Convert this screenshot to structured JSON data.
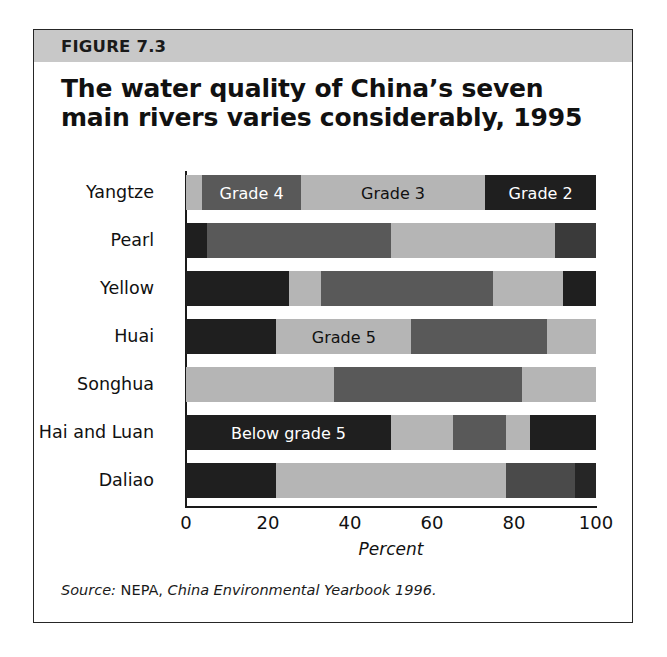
{
  "figure": {
    "number_label": "FIGURE 7.3",
    "title": "The water quality of China’s seven main rivers varies considerably, 1995",
    "source_prefix": "Source:",
    "source_agency": " NEPA, ",
    "source_title": "China Environmental Yearbook 1996."
  },
  "colors": {
    "header_band": "#c8c8c8",
    "border": "#262626",
    "grade2": "#1f1f1f",
    "grade3": "#b5b5b5",
    "grade4": "#595959",
    "grade5": "#b5b5b5",
    "below_grade5": "#1f1f1f",
    "text_light": "#ffffff",
    "text_dark": "#111111"
  },
  "chart_data": {
    "type": "bar",
    "orientation": "horizontal",
    "stacked": true,
    "normalized": true,
    "title": "The water quality of China’s seven main rivers varies considerably, 1995",
    "xlabel": "Percent",
    "ylabel": "",
    "xlim": [
      0,
      100
    ],
    "xticks": [
      0,
      20,
      40,
      60,
      80,
      100
    ],
    "xtick_labels": [
      "0",
      "20",
      "40",
      "60",
      "80",
      "100"
    ],
    "grid": false,
    "legend_position": "inline-annotations",
    "categories": [
      "Yangtze",
      "Pearl",
      "Yellow",
      "Huai",
      "Songhua",
      "Hai and Luan",
      "Daliao"
    ],
    "series": [
      {
        "name": "Grade 2",
        "color": "#1f1f1f",
        "values": [
          4,
          5,
          0,
          0,
          0,
          0,
          0
        ]
      },
      {
        "name": "Grade 3",
        "color": "#b5b5b5",
        "values": [
          0,
          0,
          0,
          0,
          0,
          0,
          0
        ]
      },
      {
        "name": "Grade 4",
        "color": "#595959",
        "values": [
          0,
          0,
          0,
          0,
          0,
          0,
          0
        ]
      },
      {
        "name": "Grade 5",
        "color": "#b5b5b5",
        "values": [
          0,
          0,
          0,
          0,
          0,
          0,
          0
        ]
      },
      {
        "name": "Below grade 5",
        "color": "#1f1f1f",
        "values": [
          0,
          0,
          0,
          0,
          0,
          0,
          0
        ]
      }
    ],
    "annotations": [
      {
        "text": "Grade 4",
        "row": "Yangtze",
        "color": "#ffffff"
      },
      {
        "text": "Grade 3",
        "row": "Yangtze",
        "color": "#111111"
      },
      {
        "text": "Grade 2",
        "row": "Yangtze",
        "color": "#ffffff"
      },
      {
        "text": "Grade 5",
        "row": "Huai",
        "color": "#111111"
      },
      {
        "text": "Below grade 5",
        "row": "Hai and Luan",
        "color": "#ffffff"
      }
    ],
    "rows": [
      {
        "label": "Yangtze",
        "segments": [
          {
            "grade": "Grade 3",
            "value": 4,
            "color": "#b5b5b5",
            "label": "",
            "label_color": "#111111"
          },
          {
            "grade": "Grade 4",
            "value": 24,
            "color": "#595959",
            "label": "Grade 4",
            "label_color": "#ffffff"
          },
          {
            "grade": "Grade 3",
            "value": 45,
            "color": "#b5b5b5",
            "label": "Grade 3",
            "label_color": "#111111"
          },
          {
            "grade": "Grade 2",
            "value": 27,
            "color": "#1f1f1f",
            "label": "Grade 2",
            "label_color": "#ffffff"
          }
        ]
      },
      {
        "label": "Pearl",
        "segments": [
          {
            "grade": "Grade 2",
            "value": 5,
            "color": "#1f1f1f",
            "label": "",
            "label_color": "#ffffff"
          },
          {
            "grade": "Grade 4",
            "value": 45,
            "color": "#595959",
            "label": "",
            "label_color": "#ffffff"
          },
          {
            "grade": "Grade 3",
            "value": 40,
            "color": "#b5b5b5",
            "label": "",
            "label_color": "#111111"
          },
          {
            "grade": "Below grade 5",
            "value": 10,
            "color": "#3a3a3a",
            "label": "",
            "label_color": "#ffffff"
          }
        ]
      },
      {
        "label": "Yellow",
        "segments": [
          {
            "grade": "Grade 2",
            "value": 25,
            "color": "#1f1f1f",
            "label": "",
            "label_color": "#ffffff"
          },
          {
            "grade": "Grade 3",
            "value": 8,
            "color": "#b5b5b5",
            "label": "",
            "label_color": "#111111"
          },
          {
            "grade": "Grade 4",
            "value": 42,
            "color": "#595959",
            "label": "",
            "label_color": "#ffffff"
          },
          {
            "grade": "Grade 5",
            "value": 17,
            "color": "#b5b5b5",
            "label": "",
            "label_color": "#111111"
          },
          {
            "grade": "Below grade 5",
            "value": 8,
            "color": "#1f1f1f",
            "label": "",
            "label_color": "#ffffff"
          }
        ]
      },
      {
        "label": "Huai",
        "segments": [
          {
            "grade": "Grade 2",
            "value": 22,
            "color": "#1f1f1f",
            "label": "",
            "label_color": "#ffffff"
          },
          {
            "grade": "Grade 5",
            "value": 33,
            "color": "#b5b5b5",
            "label": "Grade 5",
            "label_color": "#111111"
          },
          {
            "grade": "Grade 4",
            "value": 33,
            "color": "#595959",
            "label": "",
            "label_color": "#ffffff"
          },
          {
            "grade": "Grade 3",
            "value": 12,
            "color": "#b5b5b5",
            "label": "",
            "label_color": "#111111"
          }
        ]
      },
      {
        "label": "Songhua",
        "segments": [
          {
            "grade": "Grade 3",
            "value": 36,
            "color": "#b5b5b5",
            "label": "",
            "label_color": "#111111"
          },
          {
            "grade": "Grade 4",
            "value": 46,
            "color": "#595959",
            "label": "",
            "label_color": "#ffffff"
          },
          {
            "grade": "Grade 5",
            "value": 18,
            "color": "#b5b5b5",
            "label": "",
            "label_color": "#111111"
          }
        ]
      },
      {
        "label": "Hai and Luan",
        "segments": [
          {
            "grade": "Below grade 5",
            "value": 50,
            "color": "#1f1f1f",
            "label": "Below grade 5",
            "label_color": "#ffffff"
          },
          {
            "grade": "Grade 3",
            "value": 15,
            "color": "#b5b5b5",
            "label": "",
            "label_color": "#111111"
          },
          {
            "grade": "Grade 4",
            "value": 13,
            "color": "#595959",
            "label": "",
            "label_color": "#ffffff"
          },
          {
            "grade": "Grade 5",
            "value": 6,
            "color": "#b5b5b5",
            "label": "",
            "label_color": "#111111"
          },
          {
            "grade": "Grade 2",
            "value": 16,
            "color": "#1f1f1f",
            "label": "",
            "label_color": "#ffffff"
          }
        ]
      },
      {
        "label": "Daliao",
        "segments": [
          {
            "grade": "Grade 2",
            "value": 22,
            "color": "#1f1f1f",
            "label": "",
            "label_color": "#ffffff"
          },
          {
            "grade": "Grade 3",
            "value": 56,
            "color": "#b5b5b5",
            "label": "",
            "label_color": "#111111"
          },
          {
            "grade": "Grade 4",
            "value": 17,
            "color": "#4a4a4a",
            "label": "",
            "label_color": "#ffffff"
          },
          {
            "grade": "Below grade 5",
            "value": 5,
            "color": "#262626",
            "label": "",
            "label_color": "#ffffff"
          }
        ]
      }
    ]
  }
}
